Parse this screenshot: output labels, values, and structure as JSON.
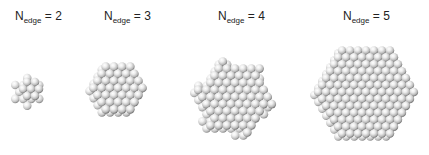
{
  "figure": {
    "background": "#ffffff",
    "atom_color_light": "#ffffff",
    "atom_color_mid": "#d6d6d6",
    "atom_color_dark": "#7a7a7a",
    "clusters": [
      {
        "label_main": "N",
        "label_sub": "edge",
        "label_rest": " = 2",
        "n_edge": 2,
        "label_x": 15,
        "cx": 31,
        "cy": 89,
        "radius": 19,
        "atom_r": 4.2
      },
      {
        "label_main": "N",
        "label_sub": "edge",
        "label_rest": " = 3",
        "n_edge": 3,
        "label_x": 104,
        "cx": 118,
        "cy": 88,
        "radius": 31,
        "atom_r": 4.3
      },
      {
        "label_main": "N",
        "label_sub": "edge",
        "label_rest": " = 4",
        "n_edge": 4,
        "label_x": 218,
        "cx": 235,
        "cy": 97,
        "radius": 44,
        "atom_r": 4.3
      },
      {
        "label_main": "N",
        "label_sub": "edge",
        "label_rest": " = 5",
        "n_edge": 5,
        "label_x": 343,
        "cx": 366,
        "cy": 92,
        "radius": 58,
        "atom_r": 4.2
      }
    ]
  }
}
